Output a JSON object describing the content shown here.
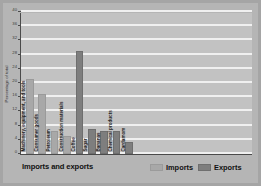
{
  "chart_data": {
    "type": "bar",
    "title": "Imports and exports",
    "xlabel": "",
    "ylabel": "Percentage of total",
    "ylim": [
      0,
      40
    ],
    "yticks": [
      0,
      4,
      8,
      12,
      16,
      20,
      24,
      28,
      32,
      36,
      40
    ],
    "grid": true,
    "legend_position": "bottom-right",
    "legend": [
      "Imports",
      "Exports"
    ],
    "categories": [
      "Machinery, equipment, and tools",
      "Consumer goods",
      "Petroleum",
      "Construction materials",
      "Coffee",
      "Sugar",
      "Bananas",
      "Chemical products",
      "Cardamom"
    ],
    "series": [
      {
        "name": "Imports",
        "values": [
          21,
          17,
          6.5,
          5,
          null,
          null,
          null,
          null,
          null
        ]
      },
      {
        "name": "Exports",
        "values": [
          null,
          null,
          null,
          null,
          29,
          7,
          6.5,
          6.5,
          3.5
        ]
      }
    ],
    "bars": [
      {
        "category": "Machinery, equipment, and tools",
        "series": "Imports",
        "value": 21
      },
      {
        "category": "Consumer goods",
        "series": "Imports",
        "value": 17
      },
      {
        "category": "Petroleum",
        "series": "Imports",
        "value": 6.5
      },
      {
        "category": "Construction materials",
        "series": "Imports",
        "value": 5
      },
      {
        "category": "Coffee",
        "series": "Exports",
        "value": 29
      },
      {
        "category": "Sugar",
        "series": "Exports",
        "value": 7
      },
      {
        "category": "Bananas",
        "series": "Exports",
        "value": 6.5
      },
      {
        "category": "Chemical products",
        "series": "Exports",
        "value": 6.5
      },
      {
        "category": "Cardamom",
        "series": "Exports",
        "value": 3.5
      }
    ]
  },
  "colors": {
    "imports": "#a8a8a8",
    "exports": "#7e7e7e",
    "plot_background": "#c2c2c2",
    "figure_background": "#b5b5b5",
    "gridline": "#f0f0f0",
    "axis": "#4a4a4a"
  }
}
